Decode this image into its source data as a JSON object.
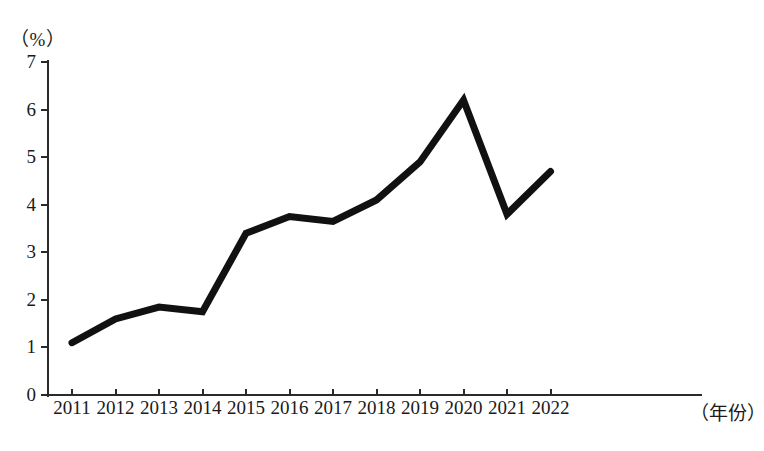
{
  "chart_data": {
    "type": "line",
    "title": "",
    "subtitle": "",
    "xlabel": "（年份）",
    "ylabel": "（%）",
    "categories": [
      "2011",
      "2012",
      "2013",
      "2014",
      "2015",
      "2016",
      "2017",
      "2018",
      "2019",
      "2020",
      "2021",
      "2022"
    ],
    "values": [
      1.1,
      1.6,
      1.85,
      1.75,
      3.4,
      3.75,
      3.65,
      4.1,
      4.9,
      6.2,
      3.8,
      4.7
    ],
    "series": [
      {
        "name": "比重",
        "values": [
          1.1,
          1.6,
          1.85,
          1.75,
          3.4,
          3.75,
          3.65,
          4.1,
          4.9,
          6.2,
          3.8,
          4.7
        ]
      }
    ],
    "ylim": [
      0,
      7
    ],
    "yticks": [
      0,
      1,
      2,
      3,
      4,
      5,
      6,
      7
    ],
    "ytick_labels": [
      "0",
      "1",
      "2",
      "3",
      "4",
      "5",
      "6",
      "7"
    ],
    "xtick_labels": [
      "2011",
      "2012",
      "2013",
      "2014",
      "2015",
      "2016",
      "2017",
      "2018",
      "2019",
      "2020",
      "2021",
      "2022"
    ],
    "grid": false,
    "legend": "none",
    "line_color": "#111111",
    "line_width": 7,
    "markers": false
  },
  "axes": {
    "y_unit": "（%）",
    "x_unit": "（年份）",
    "y_ticks": [
      "0",
      "1",
      "2",
      "3",
      "4",
      "5",
      "6",
      "7"
    ],
    "x_ticks": [
      "2011",
      "2012",
      "2013",
      "2014",
      "2015",
      "2016",
      "2017",
      "2018",
      "2019",
      "2020",
      "2021",
      "2022"
    ]
  },
  "caption": {
    "text": ""
  }
}
